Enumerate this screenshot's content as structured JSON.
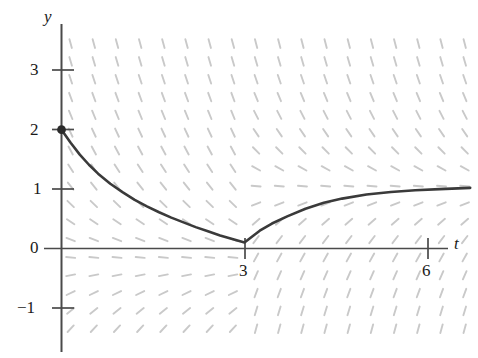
{
  "figure": {
    "background_color": "#ffffff",
    "axis_color": "#4a4a4a",
    "curve_color": "#3a3a3a",
    "slopefield_color": "#c9c9c9"
  },
  "chart_data": {
    "type": "line",
    "title": "",
    "xlabel": "t",
    "ylabel": "y",
    "grid": false,
    "legend": "none",
    "xlim": [
      -0.2,
      6.8
    ],
    "ylim": [
      -1.45,
      3.55
    ],
    "xticks": [
      3,
      6
    ],
    "xticklabels": [
      "3",
      "6"
    ],
    "yticks": [
      -1,
      0,
      1,
      2,
      3
    ],
    "yticklabels": [
      "−1",
      "0",
      "1",
      "2",
      "3"
    ],
    "annotations": [
      {
        "name": "initial-point",
        "x": 0,
        "y": 2,
        "marker": "filled-dot"
      },
      {
        "name": "corner-point",
        "x": 3,
        "y": 0.1,
        "marker": "cusp"
      }
    ],
    "series": [
      {
        "name": "solution-curve",
        "style": "solid",
        "color": "#3a3a3a",
        "x": [
          0.0,
          0.15,
          0.3,
          0.45,
          0.6,
          0.8,
          1.0,
          1.2,
          1.4,
          1.6,
          1.8,
          2.0,
          2.2,
          2.4,
          2.6,
          2.8,
          3.0,
          3.1,
          3.25,
          3.45,
          3.7,
          4.0,
          4.3,
          4.6,
          5.0,
          5.4,
          5.8,
          6.2,
          6.7
        ],
        "y": [
          2.0,
          1.78,
          1.58,
          1.41,
          1.26,
          1.09,
          0.95,
          0.82,
          0.71,
          0.61,
          0.52,
          0.44,
          0.36,
          0.29,
          0.22,
          0.16,
          0.1,
          0.18,
          0.3,
          0.42,
          0.54,
          0.67,
          0.77,
          0.84,
          0.91,
          0.95,
          0.98,
          1.0,
          1.02
        ]
      }
    ],
    "slope_field": {
      "description": "Dashed light-gray line elements showing dy/dt direction",
      "t_range": [
        0.15,
        6.75
      ],
      "y_range": [
        -1.35,
        3.45
      ],
      "t_step": 0.38,
      "y_step": 0.3,
      "equilibrium_line_y": 1,
      "equilibrium_visible_for_t_greater_than": 3
    }
  }
}
